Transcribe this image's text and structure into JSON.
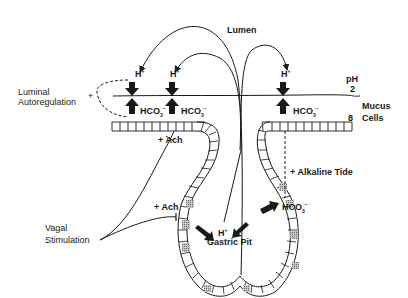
{
  "diagram": {
    "title": "",
    "labels": {
      "lumen": "Lumen",
      "ph_label": "pH",
      "ph_lumen_value": "2",
      "ph_mucus_value": "8",
      "mucus_cells": "Mucus\nCells",
      "mucus_line1": "Mucus",
      "mucus_line2": "Cells",
      "luminal_autoregulation_line1": "Luminal",
      "luminal_autoregulation_line2": "Autoregulation",
      "luminal_plus": "+",
      "vagal_stimulation_line1": "Vagal",
      "vagal_stimulation_line2": "Stimulation",
      "ach_upper": "+ Ach",
      "ach_lower": "+ Ach",
      "alkaline_tide": "+ Alkaline Tide",
      "gastric_pit": "Gastric Pit"
    },
    "ions": {
      "h_plus_base": "H",
      "h_plus_sup": "+",
      "hco3_base": "HCO",
      "hco3_sub": "3",
      "hco3_sup": "−"
    },
    "nodes": [
      {
        "id": "h-left",
        "text": "H+",
        "x": 138,
        "y": 82
      },
      {
        "id": "h-mid",
        "text": "H+",
        "x": 174,
        "y": 82
      },
      {
        "id": "h-right",
        "text": "H+",
        "x": 285,
        "y": 82
      },
      {
        "id": "hco3-left",
        "text": "HCO3-",
        "x": 140,
        "y": 105
      },
      {
        "id": "hco3-mid",
        "text": "HCO3-",
        "x": 184,
        "y": 105
      },
      {
        "id": "hco3-right",
        "text": "HCO3-",
        "x": 293,
        "y": 105
      },
      {
        "id": "hco3-pit",
        "text": "HCO3-",
        "x": 282,
        "y": 203
      },
      {
        "id": "h-pit",
        "text": "H+",
        "x": 222,
        "y": 226
      }
    ],
    "colors": {
      "ink": "#1a1a1a",
      "background": "#ffffff",
      "cell_shade": "#9a9a9a"
    }
  }
}
